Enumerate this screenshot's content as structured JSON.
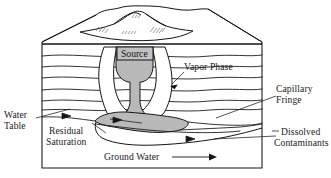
{
  "figure": {
    "background_color": "#ffffff",
    "ink_color": "#141414",
    "plume_fill_color": "#b9b9b9",
    "source_fill_color": "#c2c2c2"
  },
  "labels": {
    "source": "Source",
    "vapor_phase": "Vapor Phase",
    "capillary_fringe_line1": "Capillary",
    "capillary_fringe_line2": "Fringe",
    "water_table_line1": "Water",
    "water_table_line2": "Table",
    "residual_saturation_line1": "Residual",
    "residual_saturation_line2": "Saturation",
    "dissolved_contaminants_line1": "Dissolved",
    "dissolved_contaminants_line2": "Contaminants",
    "ground_water": "Ground Water"
  },
  "icons": {
    "flow_arrow": "groundwater-flow-arrow",
    "vapor_pointer": "vapor-phase-pointer-arrow"
  }
}
